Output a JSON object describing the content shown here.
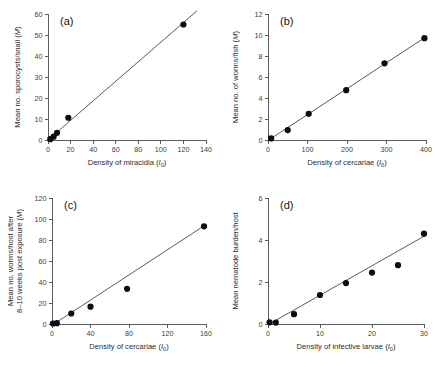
{
  "figure": {
    "background": "#ffffff",
    "point_color": "#0d0d0d",
    "line_color": "#3b3b3b",
    "axis_color": "#4a4a4a"
  },
  "chart_data": [
    {
      "id": "a",
      "type": "scatter",
      "panel_label": "(a)",
      "title": "",
      "xlabel": "Density of miracidia (I",
      "xlabel_sub": "0",
      "xlabel_tail": ")",
      "xlabel_full": "Density of miracidia (I0)",
      "ylabel_lines": [
        "Mean no. sporocysts/snail (M)"
      ],
      "ylabel_full": "Mean no. sporocysts/snail (M)",
      "xlim": [
        0,
        140
      ],
      "ylim": [
        0,
        60
      ],
      "xticks": [
        0,
        20,
        40,
        60,
        80,
        100,
        120,
        140
      ],
      "xtick_labels": [
        "0",
        "20",
        "40",
        "60",
        "80",
        "100",
        "120",
        "140"
      ],
      "yticks": [
        0,
        10,
        20,
        30,
        40,
        50,
        60
      ],
      "ytick_labels": [
        "0",
        "10",
        "20",
        "30",
        "40",
        "50",
        "60"
      ],
      "grid": false,
      "legend": "none",
      "x": [
        2,
        5,
        8,
        18,
        120
      ],
      "y": [
        0.4,
        1.6,
        3.4,
        10.6,
        55.0
      ],
      "fit_line": {
        "x": [
          0,
          132
        ],
        "y": [
          0,
          61.5
        ]
      }
    },
    {
      "id": "b",
      "type": "scatter",
      "panel_label": "(b)",
      "title": "",
      "xlabel": "Density of cercariae (I",
      "xlabel_sub": "0",
      "xlabel_tail": ")",
      "xlabel_full": "Density of cercariae (I0)",
      "ylabel_lines": [
        "Mean no. of worms/fish (M)"
      ],
      "ylabel_full": "Mean no. of worms/fish (M)",
      "xlim": [
        0,
        400
      ],
      "ylim": [
        0,
        12
      ],
      "xticks": [
        0,
        100,
        200,
        300,
        400
      ],
      "xtick_labels": [
        "0",
        "100",
        "200",
        "300",
        "400"
      ],
      "yticks": [
        0,
        2,
        4,
        6,
        8,
        10,
        12
      ],
      "ytick_labels": [
        "0",
        "2",
        "4",
        "6",
        "8",
        "10",
        "12"
      ],
      "grid": false,
      "legend": "none",
      "x": [
        8,
        50,
        103,
        198,
        295,
        396
      ],
      "y": [
        0.15,
        0.95,
        2.5,
        4.75,
        7.3,
        9.7
      ],
      "fit_line": {
        "x": [
          4,
          398
        ],
        "y": [
          0.05,
          9.78
        ]
      }
    },
    {
      "id": "c",
      "type": "scatter",
      "panel_label": "(c)",
      "title": "",
      "xlabel": "Density of cercariae (I",
      "xlabel_sub": "0",
      "xlabel_tail": ")",
      "xlabel_full": "Density of cercariae (I0)",
      "ylabel_lines": [
        "Mean no. worms/host after",
        "8–10 weeks post exposure (M)"
      ],
      "ylabel_full": "Mean no. worms/host after 8–10 weeks post exposure (M)",
      "xlim": [
        0,
        160
      ],
      "ylim": [
        0,
        120
      ],
      "xticks": [
        0,
        40,
        80,
        120,
        160
      ],
      "xtick_labels": [
        "0",
        "40",
        "80",
        "120",
        "160"
      ],
      "yticks": [
        0,
        20,
        40,
        60,
        80,
        100,
        120
      ],
      "ytick_labels": [
        "0",
        "20",
        "40",
        "60",
        "80",
        "100",
        "120"
      ],
      "grid": false,
      "legend": "none",
      "x": [
        1,
        5,
        20,
        40,
        78,
        158
      ],
      "y": [
        0.5,
        0.8,
        10.0,
        16.5,
        33.5,
        93.0
      ],
      "fit_line": {
        "x": [
          2,
          158
        ],
        "y": [
          0,
          93.5
        ]
      }
    },
    {
      "id": "d",
      "type": "scatter",
      "panel_label": "(d)",
      "title": "",
      "xlabel": "Density of infective larvae (I",
      "xlabel_sub": "0",
      "xlabel_tail": ")",
      "xlabel_full": "Density of infective larvae (I0)",
      "ylabel_lines": [
        "Mean nematode burden/host"
      ],
      "ylabel_full": "Mean nematode burden/host",
      "xlim": [
        0,
        30
      ],
      "ylim": [
        0,
        6
      ],
      "xticks": [
        0,
        10,
        20,
        30
      ],
      "xtick_labels": [
        "0",
        "10",
        "20",
        "30"
      ],
      "yticks": [
        0,
        2,
        4,
        6
      ],
      "ytick_labels": [
        "0",
        "2",
        "4",
        "6"
      ],
      "grid": false,
      "legend": "none",
      "x": [
        0.3,
        1.5,
        5,
        10,
        15,
        20,
        25,
        30
      ],
      "y": [
        0.08,
        0.07,
        0.47,
        1.38,
        1.95,
        2.45,
        2.8,
        4.3
      ],
      "fit_line": {
        "x": [
          0.4,
          30
        ],
        "y": [
          0.02,
          4.18
        ]
      }
    }
  ]
}
